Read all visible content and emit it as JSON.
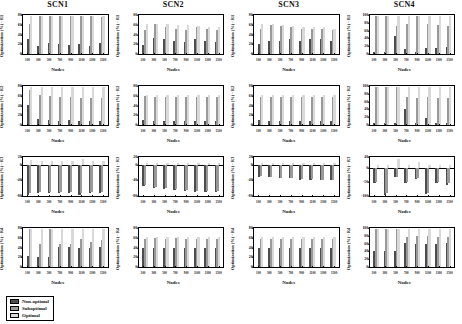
{
  "figure": {
    "xlabel": "Nodes",
    "legend": {
      "items": [
        {
          "label": "Non-optimal",
          "color": "#4d4d4d"
        },
        {
          "label": "Suboptimal",
          "color": "#999999"
        },
        {
          "label": "Optimal",
          "color": "#d9d9d9"
        }
      ]
    }
  },
  "chart_data": [
    {
      "type": "bar",
      "title": "SCN1",
      "xlabel": "Nodes",
      "ylabel": "Optimization (%) - R1",
      "categories": [
        "100",
        "300",
        "500",
        "700",
        "900",
        "1100",
        "1300",
        "1500"
      ],
      "ylim": [
        0,
        80
      ],
      "yticks": [
        0,
        20,
        40,
        60,
        80
      ],
      "grid": false,
      "legend_position": "figure-bottom-left",
      "series": [
        {
          "name": "Non-optimal",
          "values": [
            30,
            17,
            22,
            21,
            18,
            20,
            17,
            22
          ]
        },
        {
          "name": "Suboptimal",
          "values": [
            62,
            78,
            78,
            78,
            78,
            78,
            78,
            75
          ]
        },
        {
          "name": "Optimal",
          "values": [
            78,
            78,
            78,
            78,
            78,
            78,
            78,
            78
          ]
        }
      ]
    },
    {
      "type": "bar",
      "title": "SCN2",
      "xlabel": "Nodes",
      "ylabel": "Optimization (%) - R1",
      "categories": [
        "100",
        "300",
        "500",
        "700",
        "900",
        "1100",
        "1300",
        "1500"
      ],
      "ylim": [
        0,
        80
      ],
      "yticks": [
        0,
        20,
        40,
        60,
        80
      ],
      "grid": false,
      "legend_position": "figure-bottom-left",
      "series": [
        {
          "name": "Non-optimal",
          "values": [
            18,
            32,
            30,
            27,
            25,
            30,
            27,
            25
          ]
        },
        {
          "name": "Suboptimal",
          "values": [
            50,
            62,
            55,
            52,
            50,
            55,
            52,
            50
          ]
        },
        {
          "name": "Optimal",
          "values": [
            62,
            62,
            62,
            60,
            60,
            58,
            55,
            55
          ]
        }
      ]
    },
    {
      "type": "bar",
      "title": "SCN3",
      "xlabel": "Nodes",
      "ylabel": "Optimization (%) - R1",
      "categories": [
        "100",
        "300",
        "500",
        "700",
        "900",
        "1100",
        "1300",
        "1500"
      ],
      "ylim": [
        0,
        80
      ],
      "yticks": [
        0,
        20,
        40,
        60,
        80
      ],
      "grid": false,
      "legend_position": "figure-bottom-left",
      "series": [
        {
          "name": "Non-optimal",
          "values": [
            20,
            27,
            27,
            30,
            27,
            30,
            30,
            27
          ]
        },
        {
          "name": "Suboptimal",
          "values": [
            52,
            60,
            58,
            55,
            52,
            52,
            52,
            50
          ]
        },
        {
          "name": "Optimal",
          "values": [
            62,
            62,
            60,
            58,
            55,
            55,
            55,
            52
          ]
        }
      ]
    },
    {
      "type": "bar",
      "title": "SCN4",
      "xlabel": "Nodes",
      "ylabel": "Optimization (%) - R1",
      "categories": [
        "100",
        "300",
        "500",
        "700",
        "900",
        "1100",
        "1300",
        "1500"
      ],
      "ylim": [
        0,
        100
      ],
      "yticks": [
        0,
        20,
        40,
        60,
        80,
        100
      ],
      "grid": false,
      "legend_position": "figure-bottom-left",
      "series": [
        {
          "name": "Non-optimal",
          "values": [
            5,
            5,
            45,
            12,
            5,
            15,
            15,
            18
          ]
        },
        {
          "name": "Suboptimal",
          "values": [
            97,
            97,
            72,
            78,
            97,
            78,
            75,
            72
          ]
        },
        {
          "name": "Optimal",
          "values": [
            97,
            97,
            97,
            97,
            97,
            97,
            97,
            97
          ]
        }
      ]
    },
    {
      "type": "bar",
      "title": "",
      "xlabel": "Nodes",
      "ylabel": "Optimization (%) - R2",
      "categories": [
        "100",
        "300",
        "500",
        "700",
        "900",
        "1100",
        "1300",
        "1500"
      ],
      "ylim": [
        0,
        80
      ],
      "yticks": [
        0,
        20,
        40,
        60,
        80
      ],
      "grid": false,
      "legend_position": "figure-bottom-left",
      "series": [
        {
          "name": "Non-optimal",
          "values": [
            42,
            12,
            10,
            8,
            10,
            8,
            8,
            8
          ]
        },
        {
          "name": "Suboptimal",
          "values": [
            72,
            62,
            60,
            58,
            58,
            56,
            55,
            55
          ]
        },
        {
          "name": "Optimal",
          "values": [
            78,
            78,
            78,
            78,
            78,
            78,
            78,
            78
          ]
        }
      ]
    },
    {
      "type": "bar",
      "title": "",
      "xlabel": "Nodes",
      "ylabel": "Optimization (%) - R2",
      "categories": [
        "100",
        "300",
        "500",
        "700",
        "900",
        "1100",
        "1300",
        "1500"
      ],
      "ylim": [
        0,
        80
      ],
      "yticks": [
        0,
        20,
        40,
        60,
        80
      ],
      "grid": false,
      "legend_position": "figure-bottom-left",
      "series": [
        {
          "name": "Non-optimal",
          "values": [
            10,
            8,
            8,
            8,
            8,
            8,
            8,
            8
          ]
        },
        {
          "name": "Suboptimal",
          "values": [
            60,
            58,
            58,
            58,
            58,
            58,
            58,
            58
          ]
        },
        {
          "name": "Optimal",
          "values": [
            62,
            62,
            62,
            62,
            62,
            62,
            62,
            62
          ]
        }
      ]
    },
    {
      "type": "bar",
      "title": "",
      "xlabel": "Nodes",
      "ylabel": "Optimization (%) - R2",
      "categories": [
        "100",
        "300",
        "500",
        "700",
        "900",
        "1100",
        "1300",
        "1500"
      ],
      "ylim": [
        0,
        80
      ],
      "yticks": [
        0,
        20,
        40,
        60,
        80
      ],
      "grid": false,
      "legend_position": "figure-bottom-left",
      "series": [
        {
          "name": "Non-optimal",
          "values": [
            10,
            8,
            8,
            8,
            8,
            8,
            8,
            8
          ]
        },
        {
          "name": "Suboptimal",
          "values": [
            58,
            57,
            57,
            57,
            57,
            57,
            57,
            57
          ]
        },
        {
          "name": "Optimal",
          "values": [
            62,
            62,
            62,
            62,
            62,
            62,
            62,
            62
          ]
        }
      ]
    },
    {
      "type": "bar",
      "title": "",
      "xlabel": "Nodes",
      "ylabel": "Optimization (%) - R2",
      "categories": [
        "100",
        "300",
        "500",
        "700",
        "900",
        "1100",
        "1300",
        "1500"
      ],
      "ylim": [
        0,
        100
      ],
      "yticks": [
        0,
        20,
        40,
        60,
        80,
        100
      ],
      "grid": false,
      "legend_position": "figure-bottom-left",
      "series": [
        {
          "name": "Non-optimal",
          "values": [
            5,
            5,
            5,
            42,
            5,
            18,
            5,
            5
          ]
        },
        {
          "name": "Suboptimal",
          "values": [
            97,
            97,
            97,
            72,
            70,
            72,
            70,
            68
          ]
        },
        {
          "name": "Optimal",
          "values": [
            97,
            97,
            97,
            97,
            97,
            97,
            97,
            97
          ]
        }
      ]
    },
    {
      "type": "bar",
      "title": "",
      "xlabel": "Nodes",
      "ylabel": "Optimization (%) - R3",
      "categories": [
        "100",
        "300",
        "500",
        "700",
        "900",
        "1100",
        "1300",
        "1500"
      ],
      "ylim": [
        -80,
        20
      ],
      "yticks": [
        -80,
        -40,
        0,
        20
      ],
      "grid": false,
      "legend_position": "figure-bottom-left",
      "series": [
        {
          "name": "Non-optimal",
          "values": [
            -78,
            -72,
            -72,
            -72,
            -72,
            -78,
            -72,
            -72
          ]
        },
        {
          "name": "Suboptimal",
          "values": [
            -72,
            -70,
            -70,
            -70,
            -70,
            -72,
            -70,
            -70
          ]
        },
        {
          "name": "Optimal",
          "values": [
            12,
            10,
            10,
            10,
            10,
            14,
            10,
            10
          ]
        }
      ]
    },
    {
      "type": "bar",
      "title": "",
      "xlabel": "Nodes",
      "ylabel": "Optimization (%) - R3",
      "categories": [
        "100",
        "300",
        "500",
        "700",
        "900",
        "1100",
        "1300",
        "1500"
      ],
      "ylim": [
        -80,
        20
      ],
      "yticks": [
        -80,
        -40,
        0,
        20
      ],
      "grid": false,
      "legend_position": "figure-bottom-left",
      "series": [
        {
          "name": "Non-optimal",
          "values": [
            -55,
            -60,
            -62,
            -65,
            -68,
            -70,
            -70,
            -70
          ]
        },
        {
          "name": "Suboptimal",
          "values": [
            -52,
            -58,
            -60,
            -62,
            -65,
            -68,
            -68,
            -68
          ]
        },
        {
          "name": "Optimal",
          "values": [
            5,
            4,
            4,
            4,
            4,
            4,
            4,
            4
          ]
        }
      ]
    },
    {
      "type": "bar",
      "title": "",
      "xlabel": "Nodes",
      "ylabel": "Optimization (%) - R3",
      "categories": [
        "100",
        "300",
        "500",
        "700",
        "900",
        "1100",
        "1300",
        "1500"
      ],
      "ylim": [
        -80,
        20
      ],
      "yticks": [
        -80,
        -40,
        0,
        20
      ],
      "grid": false,
      "legend_position": "figure-bottom-left",
      "series": [
        {
          "name": "Non-optimal",
          "values": [
            -30,
            -32,
            -35,
            -35,
            -38,
            -38,
            -40,
            -40
          ]
        },
        {
          "name": "Suboptimal",
          "values": [
            -28,
            -30,
            -33,
            -33,
            -36,
            -36,
            -38,
            -38
          ]
        },
        {
          "name": "Optimal",
          "values": [
            4,
            4,
            4,
            4,
            4,
            4,
            4,
            4
          ]
        }
      ]
    },
    {
      "type": "bar",
      "title": "",
      "xlabel": "Nodes",
      "ylabel": "Optimization (%) - R3",
      "categories": [
        "100",
        "300",
        "500",
        "700",
        "900",
        "1100",
        "1300",
        "1500"
      ],
      "ylim": [
        -100,
        40
      ],
      "yticks": [
        -100,
        -50,
        0,
        40
      ],
      "grid": false,
      "legend_position": "figure-bottom-left",
      "series": [
        {
          "name": "Non-optimal",
          "values": [
            -52,
            -95,
            -32,
            -55,
            -38,
            -92,
            -52,
            -60
          ]
        },
        {
          "name": "Suboptimal",
          "values": [
            -48,
            -90,
            -30,
            -50,
            -35,
            -88,
            -48,
            -55
          ]
        },
        {
          "name": "Optimal",
          "values": [
            10,
            10,
            32,
            12,
            22,
            10,
            12,
            12
          ]
        }
      ]
    },
    {
      "type": "bar",
      "title": "",
      "xlabel": "Nodes",
      "ylabel": "Optimization (%) - R4",
      "categories": [
        "100",
        "300",
        "500",
        "700",
        "900",
        "1100",
        "1300",
        "1500"
      ],
      "ylim": [
        0,
        80
      ],
      "yticks": [
        0,
        20,
        40,
        60,
        80
      ],
      "grid": false,
      "legend_position": "figure-bottom-left",
      "series": [
        {
          "name": "Non-optimal",
          "values": [
            22,
            20,
            20,
            42,
            42,
            38,
            38,
            42
          ]
        },
        {
          "name": "Suboptimal",
          "values": [
            78,
            48,
            78,
            48,
            48,
            58,
            52,
            56
          ]
        },
        {
          "name": "Optimal",
          "values": [
            78,
            78,
            78,
            78,
            78,
            78,
            78,
            78
          ]
        }
      ]
    },
    {
      "type": "bar",
      "title": "",
      "xlabel": "Nodes",
      "ylabel": "Optimization (%) - R4",
      "categories": [
        "100",
        "300",
        "500",
        "700",
        "900",
        "1100",
        "1300",
        "1500"
      ],
      "ylim": [
        0,
        80
      ],
      "yticks": [
        0,
        20,
        40,
        60,
        80
      ],
      "grid": false,
      "legend_position": "figure-bottom-left",
      "series": [
        {
          "name": "Non-optimal",
          "values": [
            38,
            40,
            38,
            40,
            38,
            40,
            40,
            40
          ]
        },
        {
          "name": "Suboptimal",
          "values": [
            58,
            60,
            58,
            60,
            58,
            58,
            58,
            58
          ]
        },
        {
          "name": "Optimal",
          "values": [
            62,
            62,
            62,
            62,
            62,
            62,
            62,
            62
          ]
        }
      ]
    },
    {
      "type": "bar",
      "title": "",
      "xlabel": "Nodes",
      "ylabel": "Optimization (%) - R4",
      "categories": [
        "100",
        "300",
        "500",
        "700",
        "900",
        "1100",
        "1300",
        "1500"
      ],
      "ylim": [
        0,
        80
      ],
      "yticks": [
        0,
        20,
        40,
        60,
        80
      ],
      "grid": false,
      "legend_position": "figure-bottom-left",
      "series": [
        {
          "name": "Non-optimal",
          "values": [
            38,
            38,
            38,
            38,
            38,
            38,
            38,
            38
          ]
        },
        {
          "name": "Suboptimal",
          "values": [
            58,
            58,
            58,
            58,
            58,
            58,
            58,
            58
          ]
        },
        {
          "name": "Optimal",
          "values": [
            62,
            62,
            62,
            62,
            62,
            62,
            62,
            62
          ]
        }
      ]
    },
    {
      "type": "bar",
      "title": "",
      "xlabel": "Nodes",
      "ylabel": "Optimization (%) - R4",
      "categories": [
        "100",
        "300",
        "500",
        "700",
        "900",
        "1100",
        "1300",
        "1500"
      ],
      "ylim": [
        0,
        100
      ],
      "yticks": [
        0,
        20,
        40,
        60,
        80,
        100
      ],
      "grid": false,
      "legend_position": "figure-bottom-left",
      "series": [
        {
          "name": "Non-optimal",
          "values": [
            40,
            42,
            42,
            62,
            60,
            58,
            58,
            62
          ]
        },
        {
          "name": "Suboptimal",
          "values": [
            97,
            97,
            97,
            78,
            80,
            80,
            78,
            78
          ]
        },
        {
          "name": "Optimal",
          "values": [
            97,
            97,
            97,
            97,
            97,
            97,
            97,
            97
          ]
        }
      ]
    }
  ]
}
